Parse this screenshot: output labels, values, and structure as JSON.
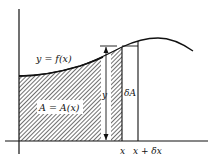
{
  "diagram": {
    "labels": {
      "curve": "y = f(x)",
      "area": "A = A(x)",
      "height": "y",
      "delta_area": "δA",
      "x_tick": "x",
      "x_delta_tick": "x + δx"
    },
    "colors": {
      "line": "#111111",
      "background": "#ffffff",
      "hatch": "#222222"
    }
  }
}
